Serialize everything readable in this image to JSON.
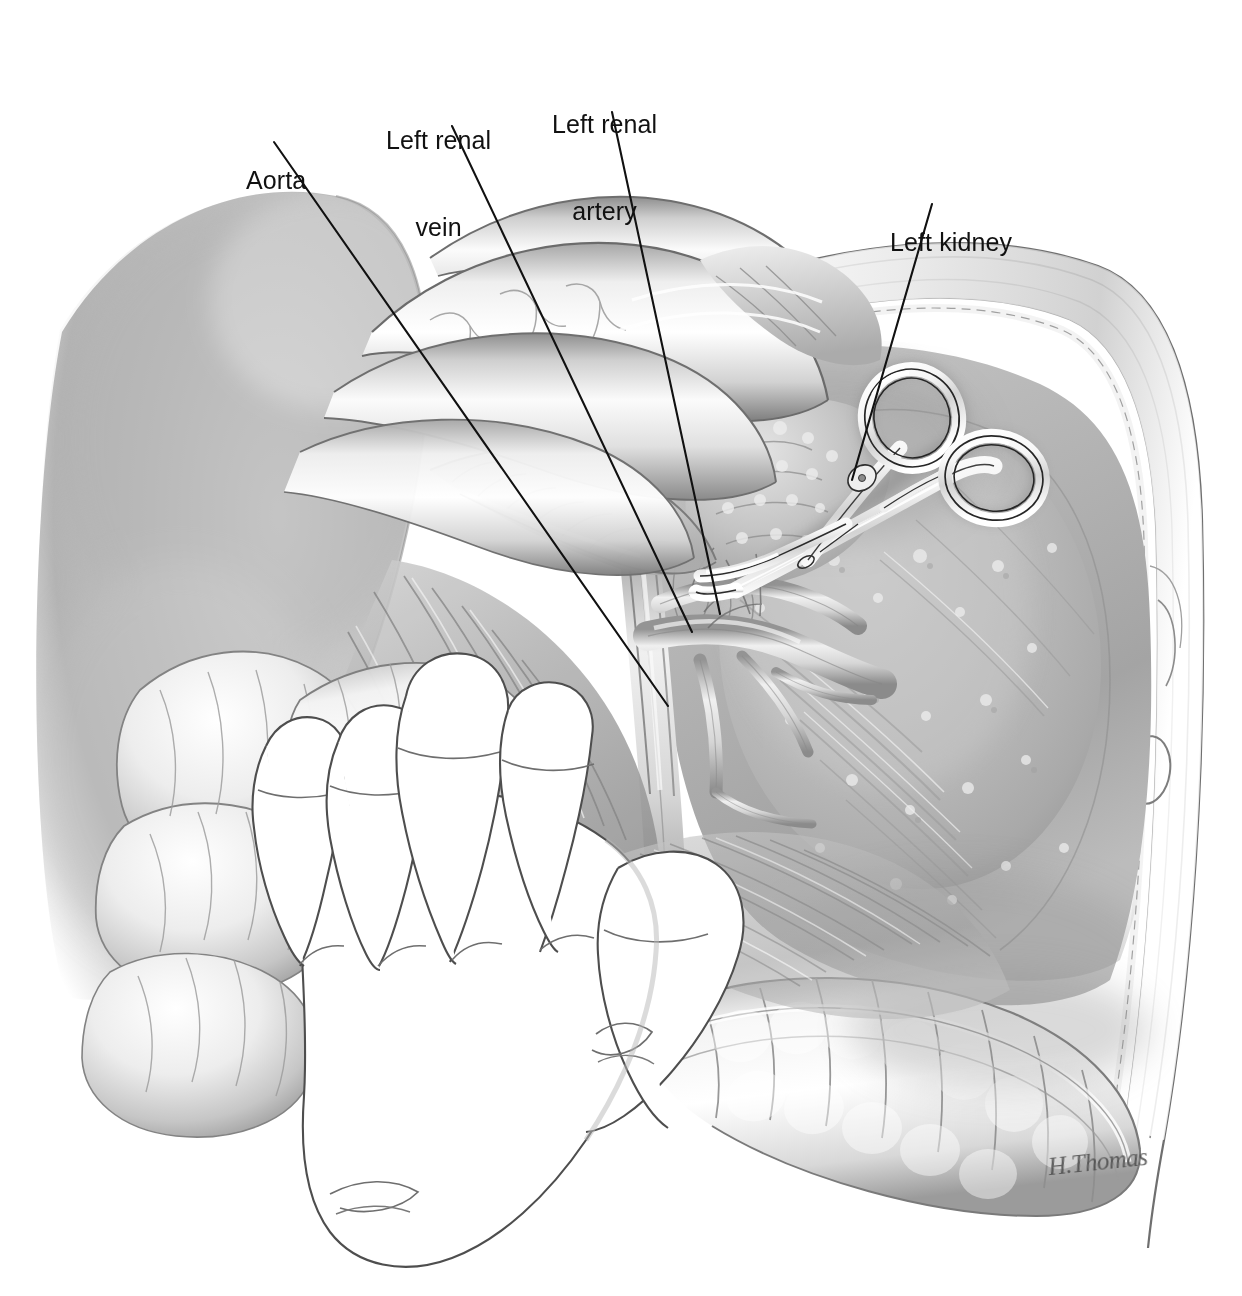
{
  "figure": {
    "kind": "medical-illustration",
    "background_color": "#ffffff",
    "ink_color": "#111111",
    "width": 1242,
    "height": 1296
  },
  "labels": [
    {
      "id": "aorta",
      "text_lines": [
        "Aorta"
      ],
      "x": 246,
      "y": 108,
      "leader": {
        "x1": 274,
        "y1": 142,
        "x2": 668,
        "y2": 706
      }
    },
    {
      "id": "left-renal-vein",
      "text_lines": [
        "Left renal",
        "vein"
      ],
      "x": 386,
      "y": 68,
      "leader": {
        "x1": 452,
        "y1": 126,
        "x2": 692,
        "y2": 632
      }
    },
    {
      "id": "left-renal-artery",
      "text_lines": [
        "Left renal",
        "artery"
      ],
      "x": 552,
      "y": 52,
      "leader": {
        "x1": 612,
        "y1": 112,
        "x2": 720,
        "y2": 614
      }
    },
    {
      "id": "left-kidney",
      "text_lines": [
        "Left kidney"
      ],
      "x": 890,
      "y": 170,
      "leader": {
        "x1": 932,
        "y1": 204,
        "x2": 852,
        "y2": 480
      }
    }
  ],
  "signature": {
    "text": "H.Thomas",
    "x": 1048,
    "y": 1148
  },
  "structures": [
    {
      "id": "liver",
      "name": "Liver (retracted, left lobe)"
    },
    {
      "id": "stomach",
      "name": "Stomach / transverse colon loops"
    },
    {
      "id": "pancreas",
      "name": "Pancreas tail"
    },
    {
      "id": "small-bowel",
      "name": "Small bowel loops and mesentery"
    },
    {
      "id": "descending-colon",
      "name": "Descending colon"
    },
    {
      "id": "left-adrenal",
      "name": "Left adrenal gland"
    },
    {
      "id": "kidney-mass",
      "name": "Left kidney in perinephric fat"
    },
    {
      "id": "body-wall",
      "name": "Abdominal body wall / peritoneal edge"
    },
    {
      "id": "surgeon-hand",
      "name": "Surgeon's gloved retracting hand"
    },
    {
      "id": "hemostat",
      "name": "Curved hemostat clamp"
    },
    {
      "id": "aorta-vessel",
      "name": "Abdominal aorta"
    },
    {
      "id": "renal-vein-vessel",
      "name": "Left renal vein"
    },
    {
      "id": "renal-artery-vessel",
      "name": "Left renal artery"
    }
  ]
}
